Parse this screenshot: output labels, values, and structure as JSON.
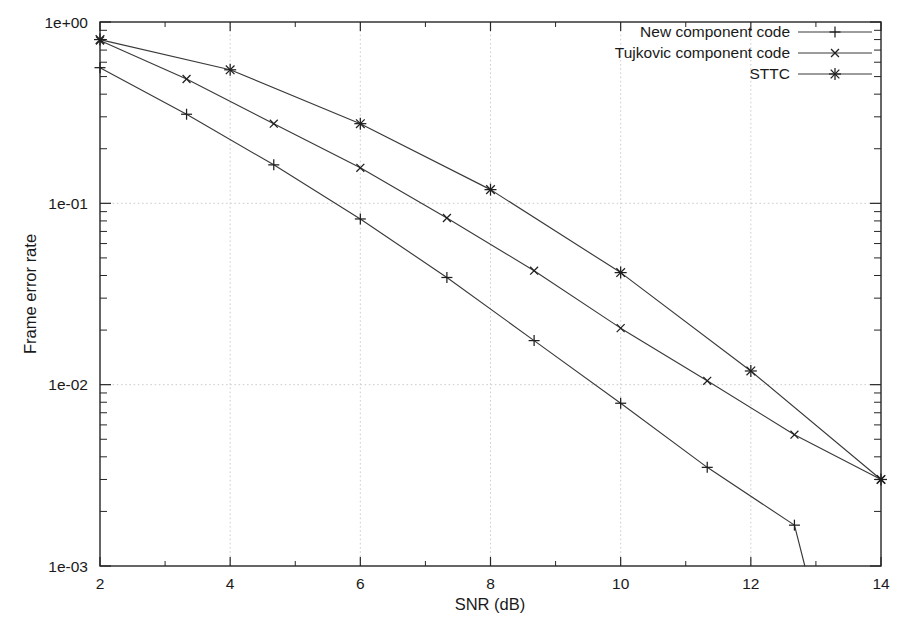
{
  "chart_data": {
    "type": "line",
    "title": "",
    "subtitle": "",
    "xlabel": "SNR (dB)",
    "ylabel": "Frame error rate",
    "xlim": [
      2,
      14
    ],
    "ylim": [
      0.001,
      1
    ],
    "yscale": "log",
    "xscale": "linear",
    "grid": true,
    "xticks": [
      2,
      4,
      6,
      8,
      10,
      12,
      14
    ],
    "xticklabels": [
      "2",
      "4",
      "6",
      "8",
      "10",
      "12",
      "14"
    ],
    "yticks": [
      1,
      0.1,
      0.01,
      0.001
    ],
    "yticklabels": [
      "1e+00",
      "1e-01",
      "1e-02",
      "1e-03"
    ],
    "legend_position": "top-right",
    "series": [
      {
        "name": "New component code",
        "marker": "plus",
        "x": [
          2.0,
          3.33,
          4.67,
          6.0,
          7.33,
          8.67,
          10.0,
          11.33,
          12.67,
          12.83
        ],
        "y": [
          0.56,
          0.31,
          0.163,
          0.082,
          0.039,
          0.0175,
          0.0079,
          0.0035,
          0.00168,
          0.001
        ]
      },
      {
        "name": "Tujkovic component code",
        "marker": "cross",
        "x": [
          2.0,
          3.33,
          4.67,
          6.0,
          7.33,
          8.67,
          10.0,
          11.33,
          12.67,
          14.0
        ],
        "y": [
          0.79,
          0.485,
          0.275,
          0.157,
          0.083,
          0.0425,
          0.0205,
          0.0105,
          0.0053,
          0.003
        ]
      },
      {
        "name": "STTC",
        "marker": "star",
        "x": [
          2.0,
          4.0,
          6.0,
          8.0,
          10.0,
          12.0,
          14.0
        ],
        "y": [
          0.8,
          0.545,
          0.275,
          0.119,
          0.0415,
          0.0119,
          0.003
        ]
      }
    ]
  },
  "legend": {
    "entries": [
      {
        "label": "New component code",
        "marker": "plus"
      },
      {
        "label": "Tujkovic component code",
        "marker": "cross"
      },
      {
        "label": "STTC",
        "marker": "star"
      }
    ]
  },
  "colors": {
    "line": "#3a3a3a",
    "marker": "#1f1f1f",
    "axis": "#262626",
    "grid": "#c8c8c8",
    "background": "#ffffff"
  }
}
